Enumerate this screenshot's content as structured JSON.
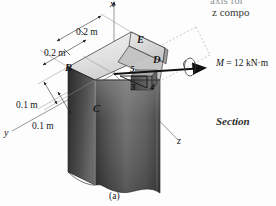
{
  "figure": {
    "caption": "(a)",
    "axes": [
      {
        "name": "x",
        "label": "x"
      },
      {
        "name": "y",
        "label": "y"
      },
      {
        "name": "z",
        "label": "z"
      }
    ],
    "point_labels": [
      {
        "id": "B",
        "label": "B"
      },
      {
        "id": "C",
        "label": "C"
      },
      {
        "id": "D",
        "label": "D"
      },
      {
        "id": "E",
        "label": "E"
      }
    ],
    "dimensions": [
      {
        "id": "dim-top-upper",
        "label": "0.2 m"
      },
      {
        "id": "dim-top-lower",
        "label": "0.2 m"
      },
      {
        "id": "dim-left-upper",
        "label": "0.1 m"
      },
      {
        "id": "dim-left-lower",
        "label": "0.1 m"
      }
    ],
    "slope_triangle": {
      "hypotenuse": "5",
      "vertical": "3",
      "horizontal": "4"
    },
    "moment": {
      "symbol": "M",
      "equals": "=",
      "value": "12",
      "unit": "kN·m",
      "full_label": "M = 12 kN·m"
    }
  },
  "page_text": {
    "line_top_cropped": "axis for",
    "line_second": "z compo",
    "section_label": "Section"
  },
  "colors": {
    "background": "#fdfdfd",
    "line": "#1a1a1a",
    "top_face_light": "#e6e6e6",
    "front_face_dark": "#3a3a3a",
    "side_face_mid": "#8f8f8f",
    "dashed_guide": "#9a9a9a"
  }
}
